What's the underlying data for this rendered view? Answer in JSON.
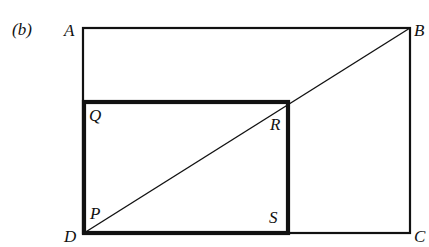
{
  "figure": {
    "part_label": "(b)",
    "part_letter": "b",
    "vertices": {
      "A": "A",
      "B": "B",
      "C": "C",
      "D": "D",
      "P": "P",
      "Q": "Q",
      "R": "R",
      "S": "S"
    }
  }
}
